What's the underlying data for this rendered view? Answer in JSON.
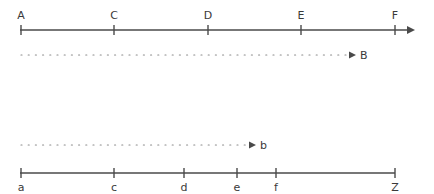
{
  "diagram": {
    "top_axis": {
      "y": 30,
      "x_start": 20,
      "x_end": 413,
      "arrow": true,
      "ticks": [
        {
          "label": "A",
          "x": 21
        },
        {
          "label": "C",
          "x": 114
        },
        {
          "label": "D",
          "x": 208
        },
        {
          "label": "E",
          "x": 301
        },
        {
          "label": "F",
          "x": 395
        }
      ]
    },
    "top_dotted_arrow": {
      "y": 55,
      "x_start": 21,
      "x_end": 356,
      "label": "B",
      "label_x": 360
    },
    "bottom_dotted_arrow": {
      "y": 145,
      "x_start": 21,
      "x_end": 256,
      "label": "b",
      "label_x": 260
    },
    "bottom_axis": {
      "y": 173,
      "x_start": 20,
      "x_end": 395,
      "arrow": false,
      "ticks": [
        {
          "label": "a",
          "x": 21
        },
        {
          "label": "c",
          "x": 114
        },
        {
          "label": "d",
          "x": 184
        },
        {
          "label": "e",
          "x": 237
        },
        {
          "label": "f",
          "x": 276
        },
        {
          "label": "Z",
          "x": 395
        }
      ]
    },
    "colors": {
      "line": "#4a4a4a",
      "dots": "#8a8a8a",
      "text": "#3a3a3a"
    }
  }
}
